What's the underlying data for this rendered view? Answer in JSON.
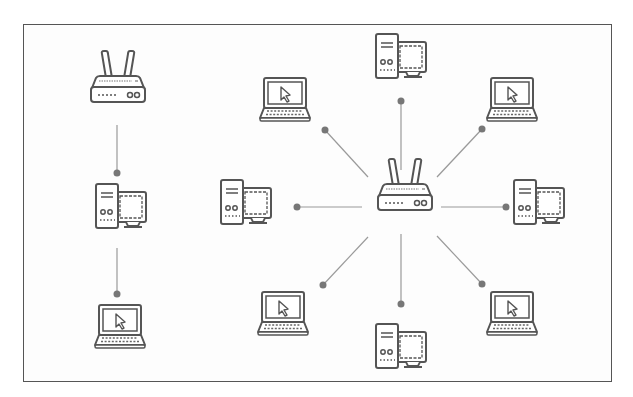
{
  "diagram": {
    "stroke_color": "#555555",
    "line_color": "#9a9a9a",
    "dot_color": "#777777",
    "frame": {
      "x": 23,
      "y": 24,
      "w": 589,
      "h": 358
    },
    "groups": [
      {
        "name": "left-chain",
        "description": "Daisy chain: router to desktop to laptop",
        "nodes": [
          {
            "id": "router-left",
            "type": "router",
            "x": 118,
            "y": 84
          },
          {
            "id": "desktop-left-chain",
            "type": "desktop",
            "x": 120,
            "y": 212
          },
          {
            "id": "laptop-left-chain",
            "type": "laptop",
            "x": 120,
            "y": 325
          }
        ],
        "edges": [
          {
            "from": "router-left",
            "to": "desktop-left-chain",
            "x1": 117,
            "y1": 125,
            "x2": 117,
            "y2": 173
          },
          {
            "from": "desktop-left-chain",
            "to": "laptop-left-chain",
            "x1": 117,
            "y1": 248,
            "x2": 117,
            "y2": 294
          }
        ]
      },
      {
        "name": "star",
        "description": "Star topology with central router",
        "hub": {
          "id": "router-center",
          "type": "router",
          "x": 405,
          "y": 192
        },
        "nodes": [
          {
            "id": "desktop-top",
            "type": "desktop",
            "x": 400,
            "y": 62
          },
          {
            "id": "laptop-top-right",
            "type": "laptop",
            "x": 512,
            "y": 98
          },
          {
            "id": "desktop-right",
            "type": "desktop",
            "x": 538,
            "y": 208
          },
          {
            "id": "laptop-bottom-right",
            "type": "laptop",
            "x": 512,
            "y": 312
          },
          {
            "id": "desktop-bottom",
            "type": "desktop",
            "x": 400,
            "y": 352
          },
          {
            "id": "laptop-bottom-left",
            "type": "laptop",
            "x": 283,
            "y": 312
          },
          {
            "id": "desktop-left",
            "type": "desktop",
            "x": 245,
            "y": 208
          },
          {
            "id": "laptop-top-left",
            "type": "laptop",
            "x": 285,
            "y": 98
          }
        ],
        "edges": [
          {
            "to": "desktop-top",
            "x1": 401,
            "y1": 170,
            "x2": 401,
            "y2": 101
          },
          {
            "to": "laptop-top-right",
            "x1": 437,
            "y1": 177,
            "x2": 482,
            "y2": 129
          },
          {
            "to": "desktop-right",
            "x1": 441,
            "y1": 207,
            "x2": 506,
            "y2": 207
          },
          {
            "to": "laptop-bottom-right",
            "x1": 437,
            "y1": 236,
            "x2": 482,
            "y2": 284
          },
          {
            "to": "desktop-bottom",
            "x1": 401,
            "y1": 234,
            "x2": 401,
            "y2": 304
          },
          {
            "to": "laptop-bottom-left",
            "x1": 368,
            "y1": 237,
            "x2": 323,
            "y2": 285
          },
          {
            "to": "desktop-left",
            "x1": 362,
            "y1": 207,
            "x2": 297,
            "y2": 207
          },
          {
            "to": "laptop-top-left",
            "x1": 368,
            "y1": 177,
            "x2": 325,
            "y2": 130
          }
        ]
      }
    ]
  }
}
